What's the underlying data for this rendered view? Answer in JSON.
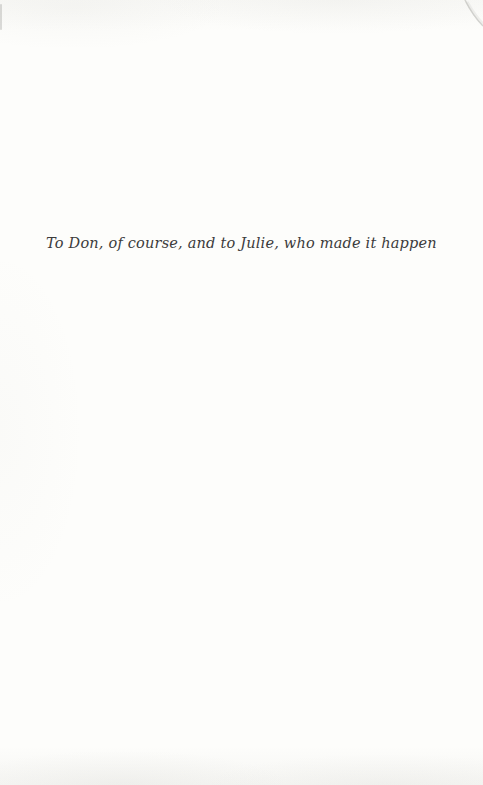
{
  "page": {
    "dedication_text": "To Don, of course, and to Julie, who made it happen"
  },
  "colors": {
    "paper": "#fdfdfb",
    "ink": "#3b3b3b",
    "edge_shading": "#a0a096"
  }
}
